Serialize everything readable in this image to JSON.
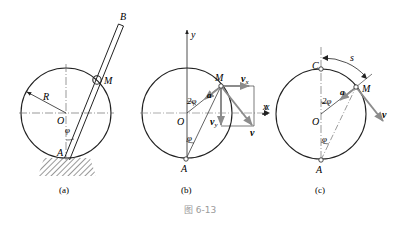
{
  "figure": {
    "caption": "图 6-13",
    "caption_color": "#9a9a9a",
    "line_color": "#222222",
    "vector_color": "#8c8c8c"
  },
  "panel_a": {
    "label": "(a)",
    "points": {
      "B": "B",
      "M": "M",
      "O": "O",
      "A": "A"
    },
    "radius_label": "R",
    "angle_label": "φ"
  },
  "panel_b": {
    "label": "(b)",
    "axes": {
      "x": "x",
      "y": "y"
    },
    "points": {
      "M": "M",
      "O": "O",
      "A": "A"
    },
    "angle_center": "2φ",
    "angle_A": "φ",
    "vectors": {
      "a": "a",
      "vx": "v",
      "vx_sub": "x",
      "vy": "v",
      "vy_sub": "y",
      "v": "v"
    }
  },
  "panel_c": {
    "label": "(c)",
    "points": {
      "C": "C",
      "M": "M",
      "O": "O",
      "A": "A"
    },
    "arc_label": "s",
    "axis_label": "x",
    "angle_center": "2φ",
    "angle_A": "φ",
    "vectors": {
      "a": "a",
      "v": "v"
    }
  }
}
